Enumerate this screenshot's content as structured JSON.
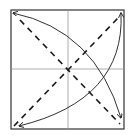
{
  "diagram": {
    "type": "origami-fold-diagram",
    "colors": {
      "background": "#ffffff",
      "outline": "#333333",
      "crease": "#999999",
      "fold_line": "#1a1a1a",
      "arrow": "#1a1a1a"
    },
    "square": {
      "x": 11,
      "y": 10,
      "size": 113
    },
    "creases": [
      {
        "name": "vertical-center-crease",
        "x1": 68,
        "y1": 10,
        "x2": 68,
        "y2": 129
      },
      {
        "name": "horizontal-center-crease",
        "x1": 11,
        "y1": 69,
        "x2": 124,
        "y2": 69
      }
    ],
    "valley_folds": [
      {
        "name": "diagonal-tl-br",
        "x1": 14,
        "y1": 13,
        "x2": 121,
        "y2": 126
      },
      {
        "name": "diagonal-bl-tr",
        "x1": 14,
        "y1": 126,
        "x2": 121,
        "y2": 13
      }
    ],
    "arrows": [
      {
        "name": "arc-top-left-to-bottom-right",
        "double_headed": true
      },
      {
        "name": "arc-top-right-to-bottom-left",
        "double_headed": true
      }
    ]
  }
}
